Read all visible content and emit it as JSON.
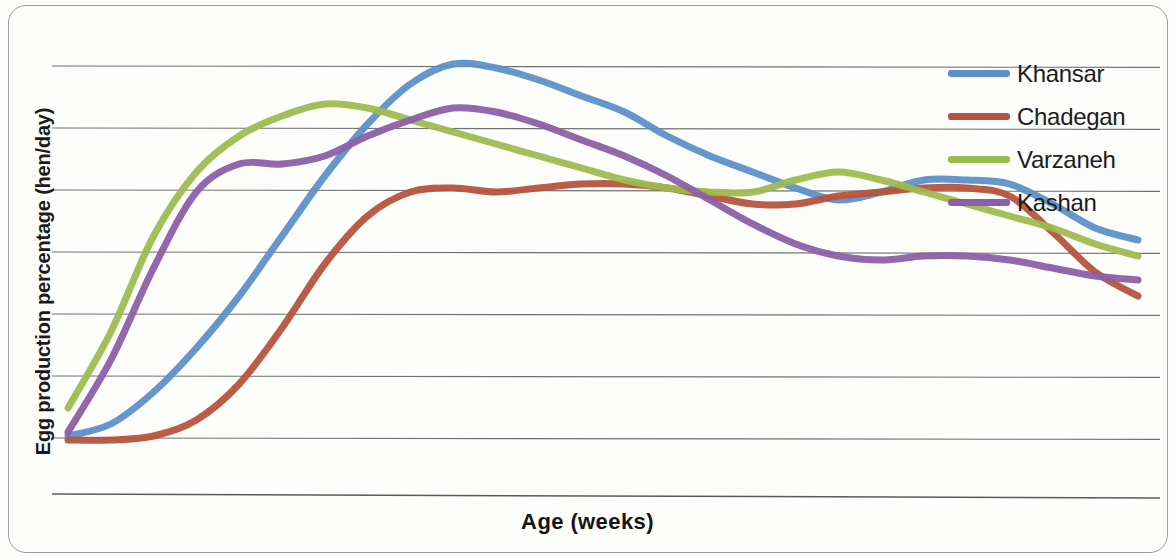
{
  "chart_data": {
    "type": "line",
    "title": "",
    "xlabel": "Age (weeks)",
    "ylabel": "Egg production percentage (hen/day)",
    "grid": true,
    "gridlines": 7,
    "axis_tick_labels": [],
    "legend_position": "top-right",
    "x_units": "weeks",
    "y_units": "percent hen/day",
    "x": [
      0,
      2,
      4,
      6,
      8,
      10,
      12,
      14,
      16,
      18,
      20,
      22,
      24,
      26,
      28,
      30,
      32,
      34,
      36,
      38,
      40,
      42,
      44,
      46,
      48,
      50
    ],
    "series": [
      {
        "name": "Khansar",
        "color": "#5B8FC9",
        "values": [
          2,
          5,
          13,
          24,
          37,
          52,
          67,
          80,
          90,
          95,
          94,
          91,
          87,
          83,
          77,
          72,
          68,
          64,
          61,
          63,
          66,
          66,
          65,
          60,
          54,
          51
        ]
      },
      {
        "name": "Chadegan",
        "color": "#B7523E",
        "values": [
          1,
          1,
          2,
          6,
          15,
          29,
          45,
          57,
          63,
          64,
          63,
          64,
          65,
          65,
          64,
          62,
          60,
          60,
          62,
          63,
          64,
          64,
          62,
          53,
          43,
          37
        ]
      },
      {
        "name": "Varzaneh",
        "color": "#9CBB4F",
        "values": [
          9,
          28,
          52,
          68,
          77,
          82,
          85,
          84,
          81,
          78,
          75,
          72,
          69,
          66,
          64,
          63,
          63,
          66,
          68,
          66,
          63,
          60,
          57,
          54,
          50,
          47
        ]
      },
      {
        "name": "Kashan",
        "color": "#8B5FA8",
        "values": [
          3,
          21,
          44,
          63,
          70,
          70,
          72,
          77,
          81,
          84,
          83,
          80,
          76,
          72,
          67,
          61,
          55,
          50,
          47,
          46,
          47,
          47,
          46,
          44,
          42,
          41
        ]
      }
    ]
  },
  "axes": {
    "y_title": "Egg production percentage (hen/day)",
    "x_title": "Age (weeks)"
  },
  "legend": {
    "items": [
      {
        "label": "Khansar",
        "color": "#5B8FC9"
      },
      {
        "label": "Chadegan",
        "color": "#B7523E"
      },
      {
        "label": "Varzaneh",
        "color": "#9CBB4F"
      },
      {
        "label": "Kashan",
        "color": "#8B5FA8"
      }
    ]
  },
  "colors": {
    "gridline": "#5a5a5a",
    "frame": "#9a9a9a",
    "background": "#fdfdfc",
    "text": "#141414"
  }
}
